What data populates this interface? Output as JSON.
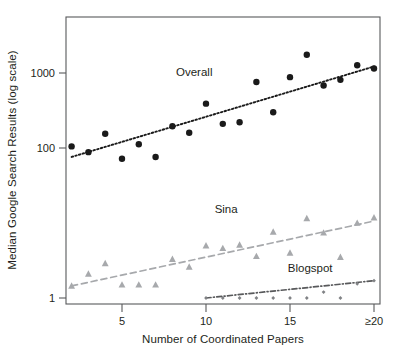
{
  "chart_data": {
    "type": "scatter",
    "title": "",
    "xlabel": "Number of Coordinated Papers",
    "ylabel": "Median Google Search Results (log scale)",
    "y_scale": "log",
    "ylim": [
      0.72,
      3100
    ],
    "xlim": [
      1.3,
      20.6
    ],
    "grid": false,
    "legend_position": "inline-annotations",
    "xticks": [
      {
        "value": 5,
        "label": "5"
      },
      {
        "value": 10,
        "label": "10"
      },
      {
        "value": 15,
        "label": "15"
      },
      {
        "value": 20,
        "label": "≥20"
      }
    ],
    "yticks": [
      {
        "value": 1000,
        "label": "1000"
      },
      {
        "value": 100,
        "label": "100"
      },
      {
        "value": 1,
        "label": "1"
      }
    ],
    "series": [
      {
        "name": "Overall",
        "marker": "circle",
        "color": "#1a1a1a",
        "fit_line_style": "dotted",
        "fit_line_color": "#1a1a1a",
        "label_x": 9.3,
        "label_y": 900,
        "x": [
          2,
          3,
          4,
          5,
          6,
          7,
          8,
          9,
          10,
          11,
          12,
          13,
          14,
          15,
          16,
          17,
          18,
          19,
          20
        ],
        "values": [
          105,
          88,
          155,
          72,
          112,
          76,
          195,
          160,
          390,
          210,
          220,
          760,
          300,
          880,
          1750,
          680,
          810,
          1270,
          1150
        ],
        "fit_endpoints": [
          [
            2,
            76
          ],
          [
            20,
            1220
          ]
        ]
      },
      {
        "name": "Sina",
        "marker": "triangle",
        "color": "#a7a9ac",
        "fit_line_style": "dashed",
        "fit_line_color": "#a7a9ac",
        "label_x": 11.2,
        "label_y": 13.5,
        "x": [
          2,
          3,
          4,
          5,
          6,
          7,
          8,
          9,
          10,
          11,
          12,
          13,
          14,
          15,
          16,
          17,
          18,
          19,
          20
        ],
        "values": [
          1.45,
          2.1,
          2.9,
          1.5,
          1.5,
          1.5,
          3.3,
          2.6,
          5.0,
          4.6,
          5.1,
          3.6,
          7.6,
          4.0,
          11.5,
          7.4,
          3.5,
          10.0,
          11.8
        ],
        "fit_endpoints": [
          [
            2,
            1.45
          ],
          [
            20,
            10.6
          ]
        ]
      },
      {
        "name": "Blogspot",
        "marker": "small-diamond",
        "color": "#808285",
        "fit_line_style": "dash-dot",
        "fit_line_color": "#58595b",
        "label_x": 16.2,
        "label_y": 2.2,
        "x": [
          10,
          11,
          12,
          13,
          14,
          15,
          16,
          17,
          18,
          19,
          20
        ],
        "values": [
          1.0,
          1.0,
          1.0,
          1.0,
          1.0,
          1.0,
          1.0,
          1.2,
          1.0,
          1.55,
          1.7
        ],
        "fit_endpoints": [
          [
            10,
            1.0
          ],
          [
            20,
            1.7
          ]
        ]
      }
    ]
  },
  "axes": {
    "x_title": "Number of Coordinated Papers",
    "y_title": "Median Google Search Results (log scale)"
  },
  "annotations": {
    "overall": "Overall",
    "sina": "Sina",
    "blogspot": "Blogspot"
  }
}
